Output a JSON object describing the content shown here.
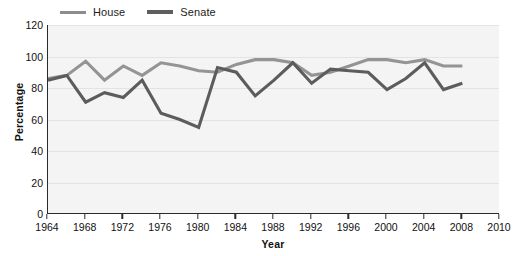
{
  "chart_data": {
    "type": "line",
    "title": "",
    "xlabel": "Year",
    "ylabel": "Percentage",
    "xlim": [
      1964,
      2010
    ],
    "ylim": [
      0,
      120
    ],
    "ytick_values": [
      0,
      20,
      40,
      60,
      80,
      100,
      120
    ],
    "xtick_values": [
      1964,
      1968,
      1972,
      1976,
      1980,
      1984,
      1988,
      1992,
      1996,
      2000,
      2004,
      2008,
      2010
    ],
    "grid": "horizontal",
    "legend_position": "top-left",
    "x": [
      1964,
      1966,
      1968,
      1970,
      1972,
      1974,
      1976,
      1978,
      1980,
      1982,
      1984,
      1986,
      1988,
      1990,
      1992,
      1994,
      1996,
      1998,
      2000,
      2002,
      2004,
      2006,
      2008
    ],
    "series": [
      {
        "name": "House",
        "color": "#949494",
        "values": [
          86,
          88,
          97,
          85,
          94,
          88,
          96,
          94,
          91,
          90,
          95,
          98,
          98,
          96,
          88,
          90,
          94,
          98,
          98,
          96,
          98,
          94,
          94
        ]
      },
      {
        "name": "Senate",
        "color": "#5c5c5c",
        "values": [
          85,
          88,
          71,
          77,
          74,
          85,
          64,
          60,
          55,
          93,
          90,
          75,
          85,
          96,
          83,
          92,
          91,
          90,
          79,
          86,
          96,
          79,
          83
        ]
      }
    ],
    "legend": [
      {
        "label": "House",
        "color": "#949494"
      },
      {
        "label": "Senate",
        "color": "#5c5c5c"
      }
    ]
  },
  "axes": {
    "y_title": "Percentage",
    "x_title": "Year",
    "y_ticks": [
      "0",
      "20",
      "40",
      "60",
      "80",
      "100",
      "120"
    ],
    "x_ticks": [
      "1964",
      "1968",
      "1972",
      "1976",
      "1980",
      "1984",
      "1988",
      "1992",
      "1996",
      "2000",
      "2004",
      "2008",
      "2010"
    ]
  },
  "legend": {
    "house_label": "House",
    "senate_label": "Senate"
  },
  "colors": {
    "house": "#949494",
    "senate": "#5c5c5c",
    "plot_background": "#f4f4f4",
    "axis": "#2b2b2b",
    "gridline": "#e3e3e3"
  }
}
